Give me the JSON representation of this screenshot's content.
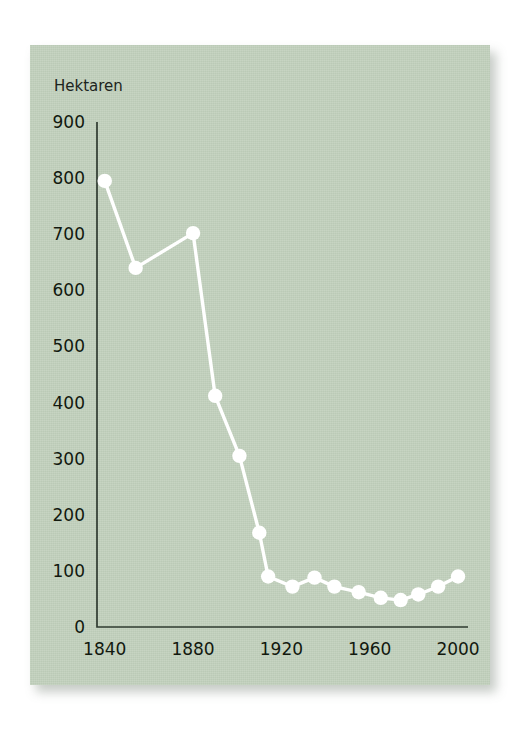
{
  "figure": {
    "panel_color": "#c2d1bd",
    "series_color": "#ffffff",
    "axis_color": "#2f3b31",
    "text_color": "#12190f"
  },
  "chart_data": {
    "type": "line",
    "title": "",
    "subtitle": "",
    "xlabel": "",
    "ylabel": "Hektaren",
    "ylabel_position": "above-axis",
    "grid": false,
    "legend": null,
    "xlim": [
      1835,
      2005
    ],
    "ylim": [
      0,
      900
    ],
    "yticks": [
      0,
      100,
      200,
      300,
      400,
      500,
      600,
      700,
      800,
      900
    ],
    "ytick_labels": [
      "0",
      "100",
      "200",
      "300",
      "400",
      "500",
      "600",
      "700",
      "800",
      "900"
    ],
    "xticks": [
      1840,
      1880,
      1920,
      1960,
      2000
    ],
    "xtick_labels": [
      "1840",
      "1880",
      "1920",
      "1960",
      "2000"
    ],
    "x": [
      1840,
      1854,
      1880,
      1890,
      1901,
      1910,
      1914,
      1925,
      1935,
      1944,
      1955,
      1965,
      1974,
      1982,
      1991,
      2000
    ],
    "values": [
      795,
      640,
      702,
      412,
      305,
      168,
      90,
      72,
      88,
      72,
      62,
      52,
      48,
      58,
      72,
      90
    ],
    "series": [
      {
        "name": "Hektaren",
        "x": [
          1840,
          1854,
          1880,
          1890,
          1901,
          1910,
          1914,
          1925,
          1935,
          1944,
          1955,
          1965,
          1974,
          1982,
          1991,
          2000
        ],
        "values": [
          795,
          640,
          702,
          412,
          305,
          168,
          90,
          72,
          88,
          72,
          62,
          52,
          48,
          58,
          72,
          90
        ]
      }
    ],
    "annotations": []
  }
}
